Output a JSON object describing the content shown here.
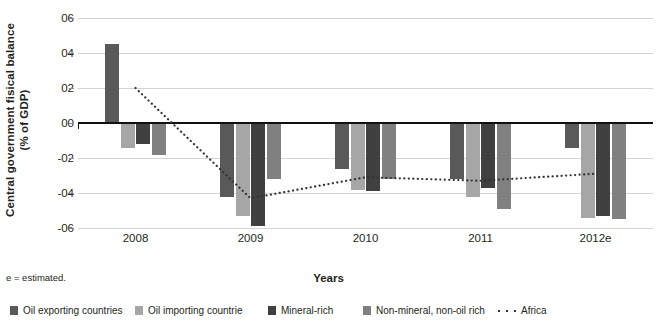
{
  "chart_data": {
    "type": "bar",
    "title": "",
    "subtitle": "",
    "xlabel": "Years",
    "ylabel": "Central government fisical balance (% of GDP)",
    "ylabel_line1": "Central government fisical balance",
    "ylabel_line2": "(% of GDP)",
    "categories": [
      "2008",
      "2009",
      "2010",
      "2011",
      "2012e"
    ],
    "ylim": [
      -6,
      6
    ],
    "yticks": [
      6,
      4,
      2,
      0,
      -2,
      -4,
      -6
    ],
    "ytick_labels": [
      "06",
      "04",
      "02",
      "00",
      "-02",
      "-04",
      "-06"
    ],
    "grid": true,
    "legend_position": "bottom",
    "footnote": "e = estimated.",
    "series": [
      {
        "name": "Oil exporting countries",
        "type": "bar",
        "color": "#595959",
        "values": [
          4.5,
          -4.2,
          -2.6,
          -3.2,
          -1.4
        ]
      },
      {
        "name": "Oil importing countrie",
        "type": "bar",
        "color": "#a6a6a6",
        "values": [
          -1.4,
          -5.3,
          -3.8,
          -4.2,
          -5.4
        ]
      },
      {
        "name": "Mineral-rich",
        "type": "bar",
        "color": "#404040",
        "values": [
          -1.2,
          -5.9,
          -3.9,
          -3.7,
          -5.3
        ]
      },
      {
        "name": "Non-mineral, non-oil rich",
        "type": "bar",
        "color": "#808080",
        "values": [
          -1.8,
          -3.2,
          -3.2,
          -4.9,
          -5.5
        ]
      },
      {
        "name": "Africa",
        "type": "line",
        "style": "dotted",
        "color": "#333333",
        "values": [
          2.0,
          -4.3,
          -3.1,
          -3.3,
          -2.9
        ]
      }
    ]
  }
}
